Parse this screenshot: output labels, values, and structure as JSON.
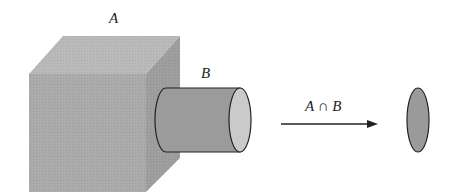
{
  "diagram": {
    "labels": {
      "set_a": "A",
      "set_b": "B",
      "intersection": "A ∩ B"
    },
    "shapes": {
      "cube": {
        "name": "A",
        "front_color": "#a9a9a9",
        "top_color": "#b8b8b8",
        "side_color": "#9c9c9c"
      },
      "cylinder": {
        "name": "B",
        "body_color": "#9a9a9a",
        "cap_color": "#c9c9c9"
      },
      "result_disc": {
        "name": "A ∩ B",
        "color": "#999999"
      }
    },
    "arrow": {
      "direction": "right"
    }
  }
}
